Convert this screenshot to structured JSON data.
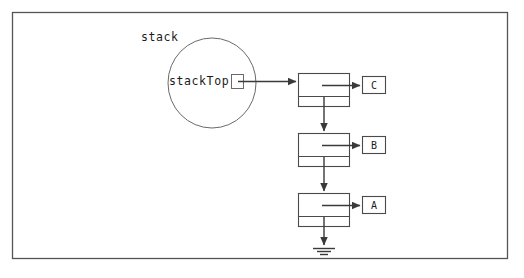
{
  "figure": {
    "background_color": "#ffffff",
    "border_color": "#555555",
    "stroke_color": "#3a3a3a",
    "text_color": "#1a1a1a",
    "frame": {
      "x": 12,
      "y": 12,
      "width": 496,
      "height": 247
    }
  },
  "labels": {
    "object_label": "stack",
    "pointer_label": "stackTop"
  },
  "stack_object": {
    "shape": "ellipse",
    "center_x": 212,
    "center_y": 83,
    "radius_x": 44,
    "radius_y": 45,
    "pointer_cell": {
      "x": 231,
      "y": 74,
      "width": 13,
      "height": 15
    }
  },
  "nodes": [
    {
      "id": "node-c",
      "data": "C",
      "box": {
        "x": 298,
        "y": 73,
        "width": 52,
        "height": 34
      },
      "divider_y": 96,
      "data_box": {
        "x": 362,
        "y": 76,
        "width": 24,
        "height": 18
      }
    },
    {
      "id": "node-b",
      "data": "B",
      "box": {
        "x": 298,
        "y": 133,
        "width": 52,
        "height": 34
      },
      "divider_y": 156,
      "data_box": {
        "x": 362,
        "y": 136,
        "width": 24,
        "height": 18
      }
    },
    {
      "id": "node-a",
      "data": "A",
      "box": {
        "x": 298,
        "y": 193,
        "width": 52,
        "height": 34
      },
      "divider_y": 216,
      "data_box": {
        "x": 362,
        "y": 196,
        "width": 24,
        "height": 18
      }
    }
  ],
  "terminator": {
    "type": "ground-null-symbol",
    "x": 324,
    "top_y": 227,
    "bars": [
      {
        "y": 248,
        "half_width": 11
      },
      {
        "y": 251,
        "half_width": 7
      },
      {
        "y": 254,
        "half_width": 4
      }
    ]
  },
  "connectors": [
    {
      "name": "stacktop-to-node-c",
      "from": "stackTop pointer cell",
      "to": "node-c",
      "orientation": "horizontal"
    },
    {
      "name": "node-c-data-arrow",
      "from": "node-c top cell",
      "to": "data box C",
      "orientation": "horizontal"
    },
    {
      "name": "node-c-to-node-b",
      "from": "node-c bottom cell",
      "to": "node-b",
      "orientation": "vertical"
    },
    {
      "name": "node-b-data-arrow",
      "from": "node-b top cell",
      "to": "data box B",
      "orientation": "horizontal"
    },
    {
      "name": "node-b-to-node-a",
      "from": "node-b bottom cell",
      "to": "node-a",
      "orientation": "vertical"
    },
    {
      "name": "node-a-data-arrow",
      "from": "node-a top cell",
      "to": "data box A",
      "orientation": "horizontal"
    },
    {
      "name": "node-a-to-null",
      "from": "node-a bottom cell",
      "to": "ground-null-symbol",
      "orientation": "vertical"
    }
  ]
}
